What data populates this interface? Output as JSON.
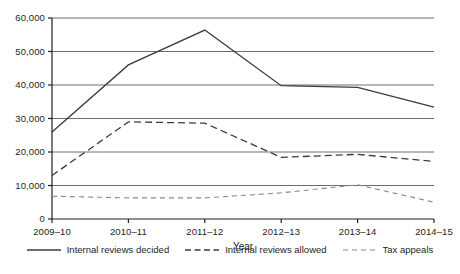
{
  "chart_data": {
    "type": "line",
    "title": "",
    "xlabel": "Year",
    "ylabel": "",
    "categories": [
      "2009–10",
      "2010–11",
      "2011–12",
      "2012–13",
      "2013–14",
      "2014–15"
    ],
    "ylim": [
      0,
      60000
    ],
    "ytick_labels": [
      "0",
      "10,000",
      "20,000",
      "30,000",
      "40,000",
      "50,000",
      "60,000"
    ],
    "ytick_values": [
      0,
      10000,
      20000,
      30000,
      40000,
      50000,
      60000
    ],
    "grid": "horizontal",
    "legend_position": "bottom",
    "series": [
      {
        "name": "Internal reviews decided",
        "style": "solid",
        "color": "#3b3b3b",
        "values": [
          26000,
          46000,
          56400,
          39800,
          39300,
          33400
        ]
      },
      {
        "name": "Internal reviews allowed",
        "style": "dashed",
        "color": "#3b3b3b",
        "values": [
          13000,
          29000,
          28600,
          18400,
          19300,
          17200
        ]
      },
      {
        "name": "Tax appeals",
        "style": "dotted-dash",
        "color": "#8a8a8a",
        "values": [
          6800,
          6300,
          6300,
          7800,
          10200,
          5000
        ]
      }
    ]
  },
  "axes": {
    "x_axis_title": "Year"
  },
  "legend": {
    "items": [
      {
        "label": "Internal reviews decided",
        "icon": "solid-line-swatch"
      },
      {
        "label": "Internal reviews allowed",
        "icon": "dashed-line-swatch"
      },
      {
        "label": "Tax appeals",
        "icon": "dotted-line-swatch"
      }
    ]
  }
}
